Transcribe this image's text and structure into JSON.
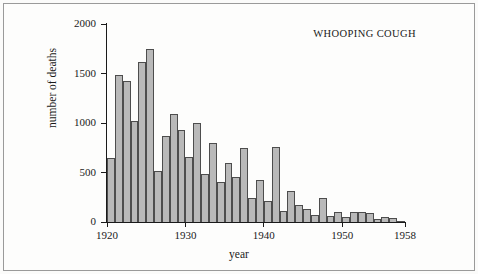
{
  "chart_data": {
    "type": "bar",
    "title": "WHOOPING COUGH",
    "xlabel": "year",
    "ylabel": "number of deaths",
    "xlim": [
      1920,
      1958
    ],
    "ylim": [
      0,
      2000
    ],
    "grid": false,
    "legend": null,
    "ytick_labels": [
      "0",
      "500",
      "1000",
      "1500",
      "2000"
    ],
    "ytick_values": [
      0,
      500,
      1000,
      1500,
      2000
    ],
    "xtick_labels": [
      "1920",
      "1930",
      "1940",
      "1950",
      "1958"
    ],
    "xtick_values": [
      1920,
      1930,
      1940,
      1950,
      1958
    ],
    "bar_fill_color": "#b9b9b9",
    "bar_edge_color": "#4d4d4d",
    "categories": [
      1920,
      1921,
      1922,
      1923,
      1924,
      1925,
      1926,
      1927,
      1928,
      1929,
      1930,
      1931,
      1932,
      1933,
      1934,
      1935,
      1936,
      1937,
      1938,
      1939,
      1940,
      1941,
      1942,
      1943,
      1944,
      1945,
      1946,
      1947,
      1948,
      1949,
      1950,
      1951,
      1952,
      1953,
      1954,
      1955,
      1956,
      1957
    ],
    "values": [
      650,
      1490,
      1420,
      1025,
      1620,
      1750,
      520,
      870,
      1090,
      930,
      660,
      1000,
      490,
      800,
      400,
      600,
      450,
      750,
      240,
      420,
      215,
      760,
      110,
      310,
      175,
      130,
      70,
      240,
      60,
      100,
      55,
      105,
      100,
      95,
      30,
      55,
      45,
      10
    ],
    "series_name": "deaths"
  }
}
